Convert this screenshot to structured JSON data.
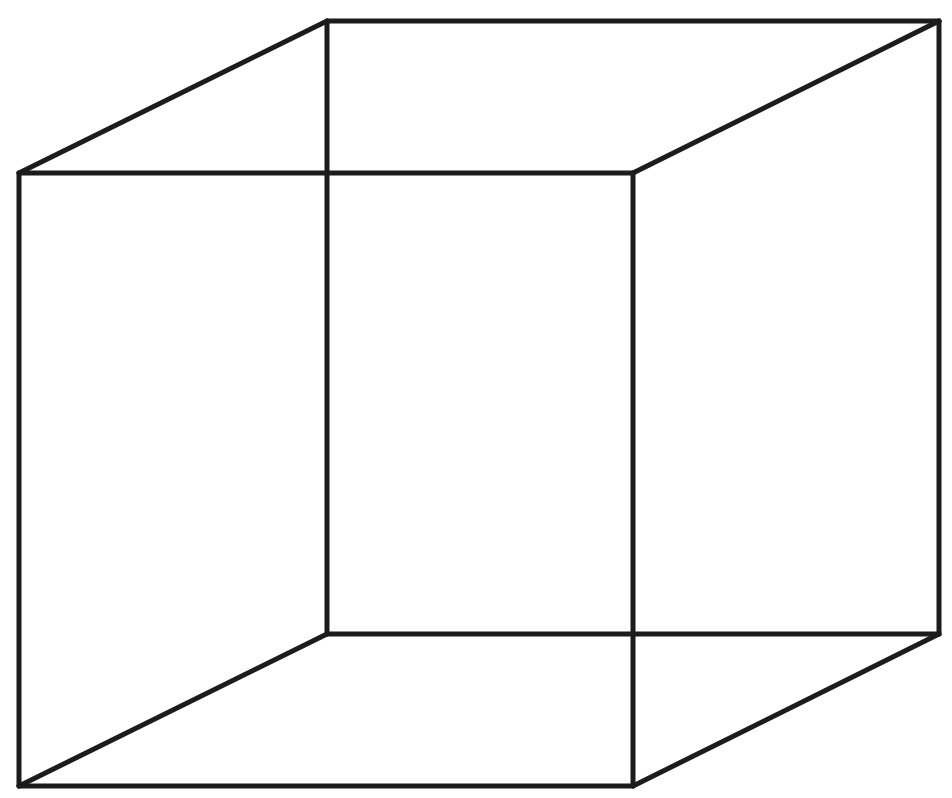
{
  "diagram": {
    "type": "wireframe-cube",
    "stroke_color": "#1c1c1c",
    "background_color": "#ffffff",
    "stroke_width": 5,
    "vertices": {
      "front_top_left": [
        19,
        173
      ],
      "front_top_right": [
        633,
        173
      ],
      "front_bottom_left": [
        19,
        786
      ],
      "front_bottom_right": [
        633,
        786
      ],
      "back_top_left": [
        327,
        21
      ],
      "back_top_right": [
        939,
        21
      ],
      "back_bottom_left": [
        327,
        634
      ],
      "back_bottom_right": [
        939,
        634
      ]
    },
    "edges": [
      [
        "front_top_left",
        "front_top_right"
      ],
      [
        "front_top_right",
        "front_bottom_right"
      ],
      [
        "front_bottom_right",
        "front_bottom_left"
      ],
      [
        "front_bottom_left",
        "front_top_left"
      ],
      [
        "back_top_left",
        "back_top_right"
      ],
      [
        "back_top_right",
        "back_bottom_right"
      ],
      [
        "back_bottom_right",
        "back_bottom_left"
      ],
      [
        "back_bottom_left",
        "back_top_left"
      ],
      [
        "front_top_left",
        "back_top_left"
      ],
      [
        "front_top_right",
        "back_top_right"
      ],
      [
        "front_bottom_left",
        "back_bottom_left"
      ],
      [
        "front_bottom_right",
        "back_bottom_right"
      ]
    ]
  }
}
